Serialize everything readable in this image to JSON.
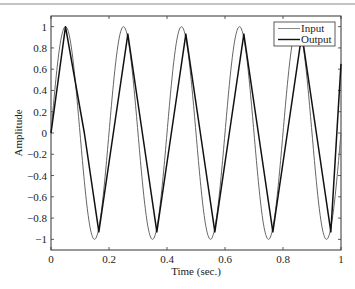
{
  "chart_data": {
    "type": "line",
    "title": "",
    "xlabel": "Time (sec.)",
    "ylabel": "Amplitude",
    "xlim": [
      0,
      1
    ],
    "ylim": [
      -1.1,
      1.1
    ],
    "grid": false,
    "legend_position": "upper right",
    "x_ticks": [
      0,
      0.2,
      0.4,
      0.6,
      0.8,
      1
    ],
    "x_tick_labels": [
      "0",
      "0.2",
      "0.4",
      "0.6",
      "0.8",
      "1"
    ],
    "y_ticks": [
      1,
      0.8,
      0.6,
      0.4,
      0.2,
      0,
      -0.2,
      -0.4,
      -0.6,
      -0.8,
      -1
    ],
    "y_tick_labels": [
      "1",
      "0.8",
      "0.6",
      "0.4",
      "0.2",
      "0",
      "−0.2",
      "−0.4",
      "−0.6",
      "−0.8",
      "−1"
    ],
    "series": [
      {
        "name": "Input",
        "description": "sine wave, 5 Hz, amplitude 1",
        "frequency_hz": 5,
        "amplitude": 1.0,
        "x": [
          0,
          0.05,
          0.1,
          0.15,
          0.2,
          0.25,
          0.3,
          0.35,
          0.4,
          0.45,
          0.5,
          0.55,
          0.6,
          0.65,
          0.7,
          0.75,
          0.8,
          0.85,
          0.9,
          0.95,
          1.0
        ],
        "values": [
          0,
          1,
          0,
          -1,
          0,
          1,
          0,
          -1,
          0,
          1,
          0,
          -1,
          0,
          1,
          0,
          -1,
          0,
          1,
          0,
          -1,
          0
        ],
        "color": "#555555"
      },
      {
        "name": "Output",
        "description": "lagged triangular-shaped response, ~5 Hz",
        "x": [
          0,
          0.05,
          0.115,
          0.165,
          0.215,
          0.265,
          0.315,
          0.365,
          0.415,
          0.465,
          0.515,
          0.565,
          0.615,
          0.665,
          0.715,
          0.765,
          0.815,
          0.865,
          0.915,
          0.965,
          1.0
        ],
        "values": [
          0,
          1.0,
          0,
          -0.93,
          0,
          0.93,
          0,
          -0.93,
          0,
          0.93,
          0,
          -0.93,
          0,
          0.93,
          0,
          -0.93,
          0,
          0.93,
          0,
          -0.93,
          0.65
        ],
        "color": "#111111"
      }
    ],
    "legend": [
      {
        "label": "Input",
        "color": "#777777"
      },
      {
        "label": "Output",
        "color": "#111111"
      }
    ]
  }
}
